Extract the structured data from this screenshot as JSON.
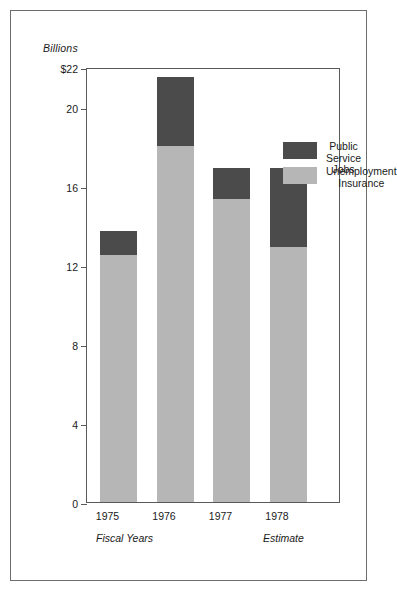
{
  "figure": {
    "axis_unit_label": "Billions",
    "footnote_left": "Fiscal Years",
    "footnote_right": "Estimate"
  },
  "legend": {
    "position": "inside-top-right",
    "items": [
      {
        "label": "Public Service\nJobs",
        "color": "#4b4b4b",
        "key": "public_service_jobs"
      },
      {
        "label": "Unemployment\nInsurance",
        "color": "#b6b6b6",
        "key": "unemployment_insurance"
      }
    ]
  },
  "axis": {
    "y_tick_labels": [
      "$22",
      "20",
      "16",
      "12",
      "8",
      "4",
      "0"
    ],
    "y_tick_values": [
      22,
      20,
      16,
      12,
      8,
      4,
      0
    ],
    "x_tick_labels": [
      "1975",
      "1976",
      "1977",
      "1978"
    ]
  },
  "chart_data": {
    "type": "bar",
    "subtype": "stacked-bar",
    "title": "",
    "subtitle": "",
    "xlabel": "Fiscal Years",
    "ylabel": "Billions",
    "categories": [
      "1975",
      "1976",
      "1977",
      "1978"
    ],
    "series": [
      {
        "name": "Unemployment Insurance",
        "color": "#b6b6b6",
        "values": [
          12.5,
          18.0,
          15.3,
          12.9
        ]
      },
      {
        "name": "Public Service Jobs",
        "color": "#4b4b4b",
        "values": [
          1.2,
          3.5,
          1.6,
          4.0
        ]
      }
    ],
    "totals": [
      13.7,
      21.5,
      16.9,
      16.9
    ],
    "ylim": [
      0,
      22
    ],
    "yticks": [
      0,
      4,
      8,
      12,
      16,
      20,
      22
    ],
    "ytick_labels": [
      "0",
      "4",
      "8",
      "12",
      "16",
      "20",
      "$22"
    ],
    "grid": false,
    "legend_position": "upper right",
    "annotations": [
      {
        "text": "Fiscal Years",
        "anchor": "below-1975"
      },
      {
        "text": "Estimate",
        "anchor": "below-1978"
      }
    ],
    "units": "Billions of dollars"
  }
}
